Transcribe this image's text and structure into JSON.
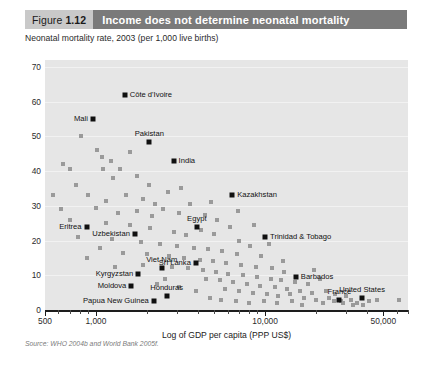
{
  "header": {
    "figure_prefix": "Figure",
    "figure_number": "1.12",
    "title": "Income does not determine neonatal mortality"
  },
  "subtitle": "Neonatal mortality rate, 2003 (per 1,000 live births)",
  "source": "Source: WHO 2004b and World Bank 2005f.",
  "colors": {
    "tag_bg": "#c9c9c9",
    "title_bg": "#7a7a7a",
    "plot_bg": "#e6e6e6",
    "point": "#9a9a9a",
    "point_highlight": "#101010",
    "axis": "#1d1d1d"
  },
  "chart_data": {
    "type": "scatter",
    "title": "Income does not determine neonatal mortality",
    "subtitle": "Neonatal mortality rate, 2003 (per 1,000 live births)",
    "xlabel": "Log of GDP per capita (PPP US$)",
    "ylabel": "Neonatal mortality rate, 2003 (per 1,000 live births)",
    "xscale": "log",
    "xlim": [
      500,
      70000
    ],
    "ylim": [
      0,
      72
    ],
    "yticks": [
      0,
      10,
      20,
      30,
      40,
      50,
      60,
      70
    ],
    "ytick_labels": [
      "0",
      "10",
      "20",
      "30",
      "40",
      "50",
      "60",
      "70"
    ],
    "xticks": [
      500,
      1000,
      10000,
      50000
    ],
    "xtick_labels": [
      "500",
      "1,000",
      "10,000",
      "50,000"
    ],
    "grid": "horizontal",
    "legend": "none",
    "labeled_points": [
      {
        "name": "Côte d'Ivoire",
        "x": 1480,
        "y": 62.0,
        "label_pos": "l"
      },
      {
        "name": "Mali",
        "x": 960,
        "y": 55.0,
        "label_pos": "r"
      },
      {
        "name": "Pakistan",
        "x": 2070,
        "y": 48.5,
        "label_pos": "c"
      },
      {
        "name": "India",
        "x": 2880,
        "y": 43.0,
        "label_pos": "l"
      },
      {
        "name": "Kazakhstan",
        "x": 6400,
        "y": 33.0,
        "label_pos": "l"
      },
      {
        "name": "Egypt",
        "x": 3950,
        "y": 24.0,
        "label_pos": "c"
      },
      {
        "name": "Eritrea",
        "x": 880,
        "y": 24.0,
        "label_pos": "r"
      },
      {
        "name": "Uzbekistan",
        "x": 1700,
        "y": 22.0,
        "label_pos": "r"
      },
      {
        "name": "Trinidad & Tobago",
        "x": 10000,
        "y": 21.0,
        "label_pos": "l"
      },
      {
        "name": "Sri Lanka",
        "x": 3900,
        "y": 13.5,
        "label_pos": "r"
      },
      {
        "name": "Viet Nam",
        "x": 2450,
        "y": 12.0,
        "label_pos": "c"
      },
      {
        "name": "Kyrgyzstan",
        "x": 1780,
        "y": 10.5,
        "label_pos": "r"
      },
      {
        "name": "Barbados",
        "x": 15200,
        "y": 9.5,
        "label_pos": "l"
      },
      {
        "name": "Moldova",
        "x": 1620,
        "y": 7.0,
        "label_pos": "r"
      },
      {
        "name": "Honduras",
        "x": 2620,
        "y": 4.0,
        "label_pos": "c"
      },
      {
        "name": "France",
        "x": 27500,
        "y": 3.0,
        "label_pos": "c"
      },
      {
        "name": "United States",
        "x": 37500,
        "y": 3.5,
        "label_pos": "c"
      },
      {
        "name": "Papua New Guinea",
        "x": 2200,
        "y": 2.5,
        "label_pos": "r"
      }
    ],
    "points": [
      {
        "x": 820,
        "y": 50.0
      },
      {
        "x": 1080,
        "y": 44.0
      },
      {
        "x": 1230,
        "y": 43.0
      },
      {
        "x": 640,
        "y": 42.0
      },
      {
        "x": 700,
        "y": 40.5
      },
      {
        "x": 1100,
        "y": 40.5
      },
      {
        "x": 1390,
        "y": 40.5
      },
      {
        "x": 760,
        "y": 36.0
      },
      {
        "x": 1270,
        "y": 38.0
      },
      {
        "x": 1020,
        "y": 46.0
      },
      {
        "x": 1760,
        "y": 38.5
      },
      {
        "x": 560,
        "y": 33.0
      },
      {
        "x": 900,
        "y": 33.0
      },
      {
        "x": 1150,
        "y": 31.5
      },
      {
        "x": 1500,
        "y": 33.0
      },
      {
        "x": 1900,
        "y": 32.0
      },
      {
        "x": 2250,
        "y": 30.5
      },
      {
        "x": 2650,
        "y": 34.0
      },
      {
        "x": 620,
        "y": 29.0
      },
      {
        "x": 1000,
        "y": 29.5
      },
      {
        "x": 1350,
        "y": 28.0
      },
      {
        "x": 1750,
        "y": 28.5
      },
      {
        "x": 2150,
        "y": 27.0
      },
      {
        "x": 2500,
        "y": 29.0
      },
      {
        "x": 3100,
        "y": 28.0
      },
      {
        "x": 3600,
        "y": 30.5
      },
      {
        "x": 4400,
        "y": 27.5
      },
      {
        "x": 5200,
        "y": 26.0
      },
      {
        "x": 700,
        "y": 26.0
      },
      {
        "x": 1150,
        "y": 25.0
      },
      {
        "x": 1600,
        "y": 24.5
      },
      {
        "x": 2100,
        "y": 23.5
      },
      {
        "x": 2900,
        "y": 22.5
      },
      {
        "x": 3400,
        "y": 21.5
      },
      {
        "x": 4200,
        "y": 23.0
      },
      {
        "x": 5000,
        "y": 22.0
      },
      {
        "x": 6200,
        "y": 24.0
      },
      {
        "x": 7000,
        "y": 20.0
      },
      {
        "x": 780,
        "y": 21.0
      },
      {
        "x": 1250,
        "y": 20.5
      },
      {
        "x": 1850,
        "y": 19.5
      },
      {
        "x": 2400,
        "y": 19.0
      },
      {
        "x": 3000,
        "y": 18.5
      },
      {
        "x": 3800,
        "y": 18.0
      },
      {
        "x": 4600,
        "y": 17.5
      },
      {
        "x": 5600,
        "y": 17.0
      },
      {
        "x": 6800,
        "y": 16.0
      },
      {
        "x": 8200,
        "y": 18.5
      },
      {
        "x": 9500,
        "y": 15.5
      },
      {
        "x": 1450,
        "y": 16.5
      },
      {
        "x": 2000,
        "y": 16.0
      },
      {
        "x": 2700,
        "y": 15.5
      },
      {
        "x": 3300,
        "y": 15.0
      },
      {
        "x": 4100,
        "y": 14.5
      },
      {
        "x": 4900,
        "y": 14.0
      },
      {
        "x": 5900,
        "y": 13.5
      },
      {
        "x": 7200,
        "y": 13.0
      },
      {
        "x": 8800,
        "y": 12.5
      },
      {
        "x": 11000,
        "y": 12.0
      },
      {
        "x": 13000,
        "y": 11.0
      },
      {
        "x": 2800,
        "y": 12.5
      },
      {
        "x": 3500,
        "y": 12.0
      },
      {
        "x": 4300,
        "y": 11.5
      },
      {
        "x": 5100,
        "y": 11.0
      },
      {
        "x": 6000,
        "y": 10.5
      },
      {
        "x": 7400,
        "y": 10.0
      },
      {
        "x": 9000,
        "y": 9.5
      },
      {
        "x": 10800,
        "y": 9.0
      },
      {
        "x": 12500,
        "y": 8.5
      },
      {
        "x": 15000,
        "y": 8.0
      },
      {
        "x": 18000,
        "y": 7.5
      },
      {
        "x": 21000,
        "y": 9.0
      },
      {
        "x": 4500,
        "y": 9.0
      },
      {
        "x": 5400,
        "y": 8.5
      },
      {
        "x": 6500,
        "y": 8.0
      },
      {
        "x": 7800,
        "y": 7.5
      },
      {
        "x": 9300,
        "y": 7.0
      },
      {
        "x": 11500,
        "y": 6.5
      },
      {
        "x": 13500,
        "y": 6.0
      },
      {
        "x": 16000,
        "y": 5.5
      },
      {
        "x": 19000,
        "y": 5.0
      },
      {
        "x": 23000,
        "y": 5.5
      },
      {
        "x": 26000,
        "y": 4.5
      },
      {
        "x": 30000,
        "y": 4.0
      },
      {
        "x": 5800,
        "y": 6.0
      },
      {
        "x": 7000,
        "y": 5.5
      },
      {
        "x": 8500,
        "y": 5.0
      },
      {
        "x": 10200,
        "y": 4.5
      },
      {
        "x": 12000,
        "y": 4.0
      },
      {
        "x": 14000,
        "y": 4.5
      },
      {
        "x": 17000,
        "y": 3.5
      },
      {
        "x": 20000,
        "y": 3.0
      },
      {
        "x": 24000,
        "y": 3.5
      },
      {
        "x": 28000,
        "y": 2.5
      },
      {
        "x": 32000,
        "y": 3.0
      },
      {
        "x": 35000,
        "y": 2.0
      },
      {
        "x": 41000,
        "y": 2.5
      },
      {
        "x": 46000,
        "y": 3.0
      },
      {
        "x": 62000,
        "y": 3.0
      },
      {
        "x": 2300,
        "y": 7.5
      },
      {
        "x": 3100,
        "y": 6.5
      },
      {
        "x": 3900,
        "y": 5.5
      },
      {
        "x": 1900,
        "y": 13.0
      },
      {
        "x": 2550,
        "y": 9.0
      },
      {
        "x": 4700,
        "y": 3.5
      },
      {
        "x": 5500,
        "y": 3.0
      },
      {
        "x": 6700,
        "y": 2.5
      },
      {
        "x": 8000,
        "y": 2.0
      },
      {
        "x": 9800,
        "y": 2.5
      },
      {
        "x": 11800,
        "y": 2.0
      },
      {
        "x": 14500,
        "y": 2.5
      },
      {
        "x": 22000,
        "y": 2.0
      },
      {
        "x": 25500,
        "y": 2.5
      },
      {
        "x": 29000,
        "y": 2.0
      },
      {
        "x": 33000,
        "y": 1.5
      },
      {
        "x": 38000,
        "y": 1.5
      },
      {
        "x": 16500,
        "y": 1.5
      },
      {
        "x": 1050,
        "y": 18.0
      },
      {
        "x": 1300,
        "y": 12.5
      },
      {
        "x": 880,
        "y": 15.0
      },
      {
        "x": 3200,
        "y": 35.0
      },
      {
        "x": 2050,
        "y": 36.0
      },
      {
        "x": 1600,
        "y": 45.5
      },
      {
        "x": 4800,
        "y": 31.0
      },
      {
        "x": 6900,
        "y": 28.5
      },
      {
        "x": 8600,
        "y": 24.5
      },
      {
        "x": 10500,
        "y": 19.0
      },
      {
        "x": 12800,
        "y": 14.0
      },
      {
        "x": 19500,
        "y": 11.5
      }
    ]
  }
}
